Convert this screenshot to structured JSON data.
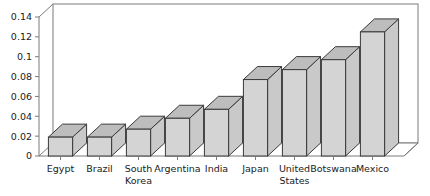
{
  "chart_data": {
    "type": "bar",
    "title": "",
    "subtitle": "",
    "xlabel": "",
    "ylabel": "",
    "categories": [
      "Egypt",
      "Brazil",
      "South Korea",
      "Argentina",
      "India",
      "Japan",
      "United States",
      "Botswana",
      "Mexico"
    ],
    "values": [
      0.019,
      0.019,
      0.027,
      0.038,
      0.047,
      0.077,
      0.087,
      0.097,
      0.125
    ],
    "ylim": [
      0,
      0.14
    ],
    "ytick_values": [
      0,
      0.02,
      0.04,
      0.06,
      0.08,
      0.1,
      0.12,
      0.14
    ],
    "ytick_labels": [
      "0",
      "0.02",
      "0.04",
      "0.06",
      "0.08",
      "0.1",
      "0.12",
      "0.14"
    ],
    "grid": false,
    "legend": null,
    "style": "3d-bars",
    "bar_face_color": "#d4d4d4",
    "bar_top_color": "#bdbdbd",
    "bar_side_color": "#c9c9c9",
    "bar_edge_color": "#3a3a3a",
    "axis_color": "#7a7a7a",
    "text_color": "#1a1a1a",
    "background_color": "#ffffff"
  },
  "labels": {
    "category_lines": [
      [
        "Egypt"
      ],
      [
        "Brazil"
      ],
      [
        "South",
        "Korea"
      ],
      [
        "Argentina"
      ],
      [
        "India"
      ],
      [
        "Japan"
      ],
      [
        "United",
        "States"
      ],
      [
        "Botswana"
      ],
      [
        "Mexico"
      ]
    ]
  }
}
